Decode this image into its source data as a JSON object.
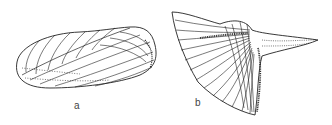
{
  "figure": {
    "panels": [
      {
        "id": "a",
        "label": "a",
        "subject": "bivalve-shell-drawing"
      },
      {
        "id": "b",
        "label": "b",
        "subject": "winged-ribbed-shell-drawing"
      }
    ],
    "colors": {
      "ink": "#222222",
      "background": "#ffffff"
    }
  }
}
